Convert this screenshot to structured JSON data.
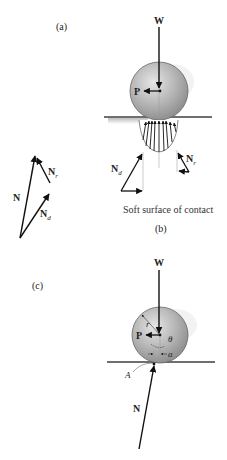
{
  "panels": {
    "a": {
      "label": "(a)"
    },
    "b": {
      "label": "(b)",
      "caption": "Soft surface of contact"
    },
    "c": {
      "label": "(c)"
    }
  },
  "forces": {
    "weight": "W",
    "push": "P",
    "normal": "N",
    "normal_d": "N",
    "normal_d_sub": "d",
    "normal_r": "N",
    "normal_r_sub": "r"
  },
  "geometry": {
    "radius": "r",
    "angle": "θ",
    "offset": "a",
    "point": "A"
  },
  "colors": {
    "wheel_light": "#d8d8d8",
    "wheel_dark": "#8a8a8a",
    "ground": "#6f6f6f",
    "arrow": "#111111"
  }
}
